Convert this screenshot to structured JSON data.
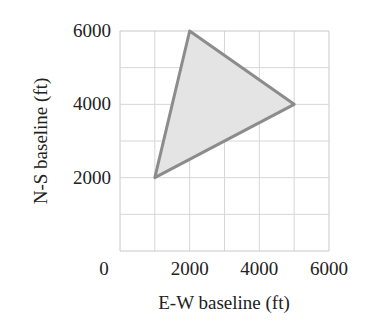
{
  "chart_data": {
    "type": "scatter",
    "subtype": "polygon",
    "title": "",
    "xlabel": "E-W baseline (ft)",
    "ylabel": "N-S baseline (ft)",
    "xlim": [
      0,
      6000
    ],
    "ylim": [
      0,
      6000
    ],
    "x_ticks": [
      0,
      2000,
      4000,
      6000
    ],
    "x_tick_labels": [
      "0",
      "2000",
      "4000",
      "6000"
    ],
    "y_ticks": [
      2000,
      4000,
      6000
    ],
    "y_tick_labels": [
      "2000",
      "4000",
      "6000"
    ],
    "grid": true,
    "grid_step": 1000,
    "series": [
      {
        "name": "triangle",
        "closed": true,
        "points": [
          {
            "x": 1000,
            "y": 2000
          },
          {
            "x": 2000,
            "y": 6000
          },
          {
            "x": 5000,
            "y": 4000
          }
        ],
        "stroke": "#8c8c8c",
        "fill": "#e4e4e4"
      }
    ],
    "legend": null
  },
  "colors": {
    "grid": "#d6d6d6",
    "axis": "#c8c8c8",
    "polygon_stroke": "#8c8c8c",
    "polygon_fill": "#e4e4e4"
  }
}
